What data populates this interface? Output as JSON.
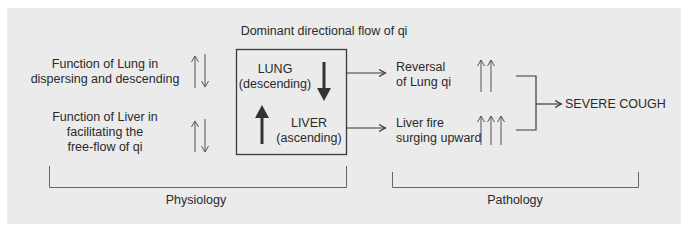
{
  "title": "Dominant directional flow of qi",
  "physiology": {
    "lung_function": [
      "Function of Lung in",
      "dispersing and descending"
    ],
    "liver_function": [
      "Function of Liver in",
      "facilitating the",
      "free-flow of qi"
    ],
    "label": "Physiology"
  },
  "box": {
    "lung": [
      "LUNG",
      "(descending)"
    ],
    "liver": [
      "LIVER",
      "(ascending)"
    ]
  },
  "pathology": {
    "lung_reversal": [
      "Reversal",
      "of Lung qi"
    ],
    "liver_fire": [
      "Liver fire",
      "surging upward"
    ],
    "outcome": "SEVERE COUGH",
    "label": "Pathology"
  },
  "colors": {
    "panel_bg": "#ebebeb",
    "line": "#3a3a3a",
    "thin_arrow": "#555555"
  },
  "icons": {
    "lung_function_arrows": "up-down-arrows",
    "liver_function_arrows": "up-down-arrows",
    "lung_box_arrow": "bold-down-arrow",
    "liver_box_arrow": "bold-up-arrow",
    "lung_reversal_arrows": "double-up-arrows",
    "liver_fire_arrows": "triple-up-arrows"
  }
}
